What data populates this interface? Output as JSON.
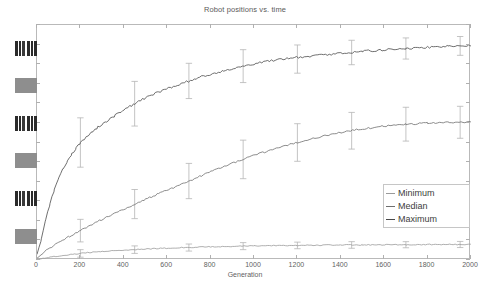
{
  "chart_data": {
    "type": "line",
    "title": "Robot positions vs. time",
    "xlabel": "Generation",
    "ylabel": "",
    "xlim": [
      0,
      2000
    ],
    "ylim": [
      0,
      1
    ],
    "grid": false,
    "legend_position": "lower-right",
    "xticks": [
      "0",
      "200",
      "400",
      "600",
      "800",
      "1000",
      "1200",
      "1400",
      "1600",
      "1800",
      "2000"
    ],
    "xtick_values": [
      0,
      200,
      400,
      600,
      800,
      1000,
      1200,
      1400,
      1600,
      1800,
      2000
    ],
    "ytick_labels": [
      "██",
      "██",
      "██",
      "██",
      "██",
      "██"
    ],
    "ytick_label_note": "y-axis tick labels render as corrupted/missing-glyph blocks",
    "ytick_values": [
      0.9,
      0.74,
      0.58,
      0.42,
      0.26,
      0.1
    ],
    "series": [
      {
        "name": "Maximum",
        "color": "#4a4a4a",
        "x": [
          0,
          20,
          40,
          60,
          80,
          100,
          120,
          140,
          160,
          180,
          200,
          240,
          280,
          320,
          360,
          400,
          450,
          500,
          560,
          620,
          680,
          740,
          800,
          860,
          920,
          1000,
          1080,
          1160,
          1240,
          1320,
          1400,
          1500,
          1600,
          1700,
          1800,
          1900,
          2000
        ],
        "y": [
          0.02,
          0.09,
          0.17,
          0.24,
          0.3,
          0.35,
          0.39,
          0.42,
          0.45,
          0.475,
          0.5,
          0.535,
          0.565,
          0.59,
          0.615,
          0.64,
          0.665,
          0.69,
          0.715,
          0.735,
          0.755,
          0.775,
          0.79,
          0.805,
          0.818,
          0.835,
          0.848,
          0.858,
          0.866,
          0.873,
          0.88,
          0.888,
          0.894,
          0.9,
          0.905,
          0.909,
          0.912
        ],
        "errorbars": [
          {
            "x": 200,
            "y": 0.5,
            "err": 0.105
          },
          {
            "x": 450,
            "y": 0.665,
            "err": 0.095
          },
          {
            "x": 700,
            "y": 0.762,
            "err": 0.075
          },
          {
            "x": 950,
            "y": 0.825,
            "err": 0.07
          },
          {
            "x": 1200,
            "y": 0.855,
            "err": 0.06
          },
          {
            "x": 1450,
            "y": 0.883,
            "err": 0.052
          },
          {
            "x": 1700,
            "y": 0.9,
            "err": 0.045
          },
          {
            "x": 1950,
            "y": 0.911,
            "err": 0.04
          }
        ]
      },
      {
        "name": "Median",
        "color": "#6e6e6e",
        "x": [
          0,
          50,
          100,
          150,
          200,
          260,
          320,
          380,
          440,
          500,
          560,
          620,
          680,
          740,
          800,
          880,
          960,
          1040,
          1120,
          1200,
          1300,
          1400,
          1500,
          1600,
          1700,
          1800,
          1900,
          2000
        ],
        "y": [
          0.01,
          0.045,
          0.075,
          0.1,
          0.125,
          0.155,
          0.182,
          0.207,
          0.232,
          0.258,
          0.282,
          0.305,
          0.328,
          0.352,
          0.375,
          0.405,
          0.432,
          0.457,
          0.48,
          0.5,
          0.523,
          0.543,
          0.558,
          0.57,
          0.578,
          0.582,
          0.585,
          0.587
        ],
        "errorbars": [
          {
            "x": 200,
            "y": 0.125,
            "err": 0.048
          },
          {
            "x": 450,
            "y": 0.238,
            "err": 0.062
          },
          {
            "x": 700,
            "y": 0.336,
            "err": 0.075
          },
          {
            "x": 950,
            "y": 0.428,
            "err": 0.082
          },
          {
            "x": 1200,
            "y": 0.5,
            "err": 0.08
          },
          {
            "x": 1450,
            "y": 0.55,
            "err": 0.078
          },
          {
            "x": 1700,
            "y": 0.578,
            "err": 0.072
          },
          {
            "x": 1950,
            "y": 0.586,
            "err": 0.068
          }
        ]
      },
      {
        "name": "Minimum",
        "color": "#9a9a9a",
        "x": [
          0,
          60,
          120,
          180,
          240,
          300,
          360,
          420,
          480,
          560,
          640,
          720,
          800,
          900,
          1000,
          1100,
          1200,
          1300,
          1400,
          1500,
          1600,
          1700,
          1800,
          1900,
          2000
        ],
        "y": [
          0.002,
          0.012,
          0.02,
          0.026,
          0.032,
          0.036,
          0.04,
          0.043,
          0.046,
          0.049,
          0.052,
          0.054,
          0.056,
          0.058,
          0.06,
          0.061,
          0.062,
          0.063,
          0.064,
          0.064,
          0.065,
          0.065,
          0.066,
          0.066,
          0.066
        ],
        "errorbars": [
          {
            "x": 200,
            "y": 0.028,
            "err": 0.016
          },
          {
            "x": 450,
            "y": 0.044,
            "err": 0.016
          },
          {
            "x": 700,
            "y": 0.053,
            "err": 0.015
          },
          {
            "x": 950,
            "y": 0.059,
            "err": 0.015
          },
          {
            "x": 1200,
            "y": 0.062,
            "err": 0.014
          },
          {
            "x": 1450,
            "y": 0.064,
            "err": 0.014
          },
          {
            "x": 1700,
            "y": 0.065,
            "err": 0.013
          },
          {
            "x": 1950,
            "y": 0.066,
            "err": 0.013
          }
        ]
      }
    ]
  },
  "legend": {
    "entries": [
      {
        "label": "Minimum",
        "color": "#9a9a9a"
      },
      {
        "label": "Median",
        "color": "#6e6e6e"
      },
      {
        "label": "Maximum",
        "color": "#4a4a4a"
      }
    ]
  },
  "colors": {
    "frame": "#b9b9b9",
    "tick": "#b0b0b0",
    "errorbar": "#b5b5b5",
    "text": "#5f5f5f",
    "background": "#ffffff"
  }
}
